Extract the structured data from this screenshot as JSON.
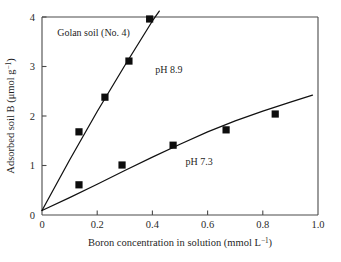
{
  "chart_data": {
    "type": "scatter",
    "title": "",
    "annotation_title": "Golan soil (No. 4)",
    "xlabel_parts": {
      "main": "Boron concentration in solution (mmol L",
      "sup": "−1",
      "tail": ")"
    },
    "xlabel": "Boron concentration in solution (mmol L−1)",
    "ylabel_parts": {
      "main": "Adsorbed soil B (μmol g",
      "sup": "−1",
      "tail": ")"
    },
    "ylabel": "Adsorbed soil B (μmol g−1)",
    "xlim": [
      0,
      1.0
    ],
    "ylim": [
      0,
      4.0
    ],
    "xticks": [
      0,
      0.2,
      0.4,
      0.6,
      0.8,
      1.0
    ],
    "xtick_labels": [
      "0",
      "0.2",
      "0.4",
      "0.6",
      "0.8",
      "1.0"
    ],
    "yticks": [
      0,
      1,
      2,
      3,
      4
    ],
    "ytick_labels": [
      "0",
      "1",
      "2",
      "3",
      "4"
    ],
    "grid": false,
    "legend_position": "inline-annotations",
    "marker_style": "filled-square",
    "marker_color": "#0d0d0d",
    "line_color": "#111111",
    "axis_color": "#4a4a4a",
    "series": [
      {
        "name": "pH 8.9",
        "label": "pH 8.9",
        "label_at": {
          "x": 0.41,
          "y": 2.86
        },
        "points": [
          {
            "x": 0.134,
            "y": 1.68
          },
          {
            "x": 0.228,
            "y": 2.38
          },
          {
            "x": 0.315,
            "y": 3.11
          },
          {
            "x": 0.39,
            "y": 3.96
          }
        ],
        "fit_curve": [
          {
            "x": 0.0,
            "y": 0.09
          },
          {
            "x": 0.1,
            "y": 1.11
          },
          {
            "x": 0.2,
            "y": 2.09
          },
          {
            "x": 0.3,
            "y": 3.02
          },
          {
            "x": 0.4,
            "y": 3.92
          },
          {
            "x": 0.425,
            "y": 4.12
          }
        ]
      },
      {
        "name": "pH 7.3",
        "label": "pH 7.3",
        "label_at": {
          "x": 0.52,
          "y": 1.02
        },
        "points": [
          {
            "x": 0.134,
            "y": 0.61
          },
          {
            "x": 0.29,
            "y": 1.01
          },
          {
            "x": 0.475,
            "y": 1.41
          },
          {
            "x": 0.667,
            "y": 1.72
          },
          {
            "x": 0.845,
            "y": 2.04
          }
        ],
        "fit_curve": [
          {
            "x": 0.0,
            "y": 0.09
          },
          {
            "x": 0.1,
            "y": 0.35
          },
          {
            "x": 0.2,
            "y": 0.62
          },
          {
            "x": 0.3,
            "y": 0.9
          },
          {
            "x": 0.4,
            "y": 1.17
          },
          {
            "x": 0.5,
            "y": 1.43
          },
          {
            "x": 0.6,
            "y": 1.68
          },
          {
            "x": 0.7,
            "y": 1.9
          },
          {
            "x": 0.8,
            "y": 2.1
          },
          {
            "x": 0.9,
            "y": 2.28
          },
          {
            "x": 0.98,
            "y": 2.42
          }
        ]
      }
    ]
  }
}
